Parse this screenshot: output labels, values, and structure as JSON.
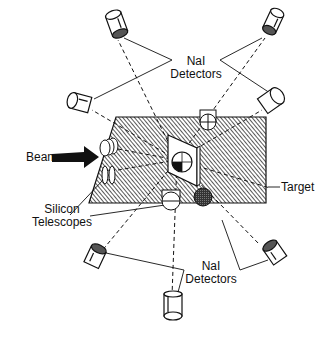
{
  "figure": {
    "labels": {
      "nai_top_line1": "NaI",
      "nai_top_line2": "Detectors",
      "nai_bottom_line1": "NaI",
      "nai_bottom_line2": "Detectors",
      "beam": "Beam",
      "silicon_line1": "Silicon",
      "silicon_line2": "Telescopes",
      "target": "Target"
    },
    "components": {
      "nai_detectors_upper": 4,
      "nai_detectors_lower": 3,
      "silicon_telescopes": 2,
      "in_plane_detectors": 3,
      "target": 1,
      "beam_direction": "left-to-right"
    },
    "colors": {
      "ink": "#111111",
      "background": "#ffffff"
    }
  }
}
